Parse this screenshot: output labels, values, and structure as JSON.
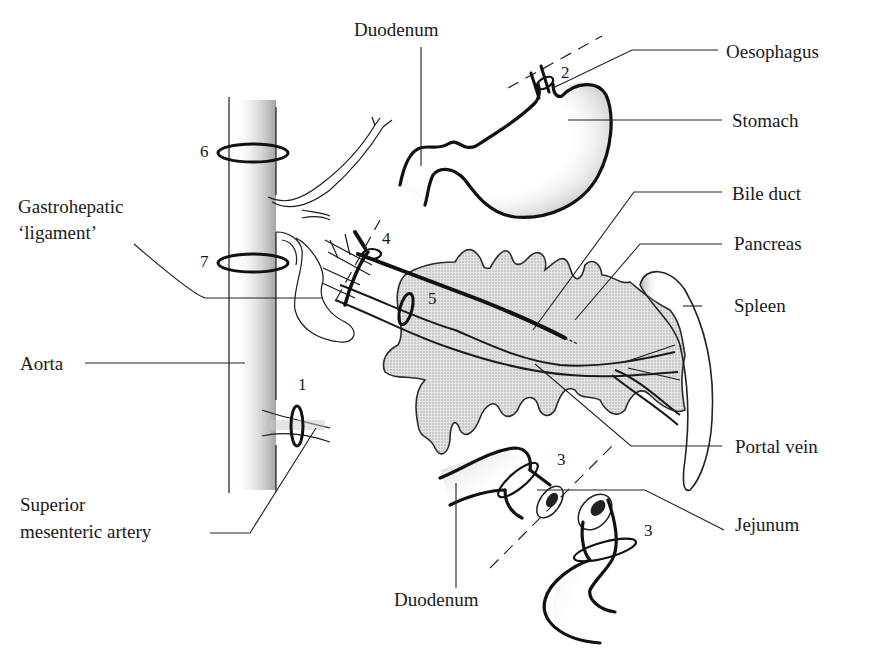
{
  "diagram": {
    "type": "anatomical line drawing",
    "labels": {
      "duodenum_top": "Duodenum",
      "oesophagus": "Oesophagus",
      "stomach": "Stomach",
      "bile_duct": "Bile duct",
      "gastrohepatic_line1": "Gastrohepatic",
      "gastrohepatic_line2": "‘ligament’",
      "pancreas": "Pancreas",
      "spleen": "Spleen",
      "aorta": "Aorta",
      "portal_vein": "Portal vein",
      "sma_line1": "Superior",
      "sma_line2": "mesenteric artery",
      "jejunum": "Jejunum",
      "duodenum_bottom": "Duodenum"
    },
    "markers": {
      "m1": "1",
      "m2": "2",
      "m3a": "3",
      "m3b": "3",
      "m4": "4",
      "m5": "5",
      "m6": "6",
      "m7": "7"
    },
    "colors": {
      "ink": "#111111",
      "stipple": "#bdbdbd",
      "pancreas_fill": "#d8d8d8",
      "background": "#ffffff"
    }
  }
}
